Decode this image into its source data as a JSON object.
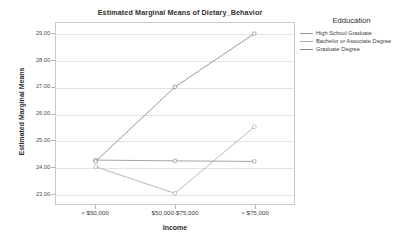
{
  "chart_data": {
    "type": "line",
    "title": "Estimated Marginal Means of Dietary_Behavior",
    "xlabel": "Income",
    "ylabel": "Estimated Marginal Means",
    "categories": [
      "< $50,000",
      "$50,000-$75,000",
      "> $75,000"
    ],
    "ylim": [
      22.6,
      29.4
    ],
    "yticks": [
      "23.00",
      "24.00",
      "25.00",
      "26.00",
      "27.00",
      "28.00",
      "29.00"
    ],
    "ytick_values": [
      23.0,
      24.0,
      25.0,
      26.0,
      27.0,
      28.0,
      29.0
    ],
    "grid": true,
    "legend_position": "right",
    "legend_title": "Edducation",
    "series": [
      {
        "name": "High School Graduate",
        "values": [
          24.25,
          24.22,
          24.2
        ],
        "color": "#9a9a9a"
      },
      {
        "name": "Bachelor or Associate Degree",
        "values": [
          24.0,
          23.0,
          25.5
        ],
        "color": "#b0b0b0"
      },
      {
        "name": "Graduate Degree",
        "values": [
          24.2,
          27.0,
          29.0
        ],
        "color": "#8a8a8a"
      }
    ]
  }
}
